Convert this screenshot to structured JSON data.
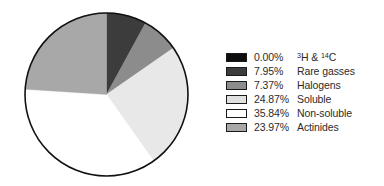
{
  "chart_data": {
    "type": "pie",
    "title": "",
    "subtitle": "",
    "xlabel": "",
    "ylabel": "",
    "legend_position": "right",
    "grid": false,
    "start_angle_deg": 0,
    "direction": "clockwise",
    "categories": [
      "3H & 14C",
      "Rare gasses",
      "Halogens",
      "Soluble",
      "Non-soluble",
      "Actinides"
    ],
    "values": [
      0.0,
      7.95,
      7.37,
      24.87,
      35.84,
      23.97
    ],
    "unit": "%",
    "slice_colors": [
      "#0d0d0d",
      "#3c3c3c",
      "#8c8c8c",
      "#e8e8e8",
      "#ffffff",
      "#a8a8a8"
    ],
    "slices": [
      {
        "label": "3H & 14C",
        "label_html": "<sup>3</sup>H &amp; <sup>14</sup>C",
        "value": 0.0,
        "percent_text": "0.00%",
        "color": "#0d0d0d",
        "swatch_color": "#0d0d0d"
      },
      {
        "label": "Rare gasses",
        "label_html": "Rare gasses",
        "value": 7.95,
        "percent_text": "7.95%",
        "color": "#3c3c3c",
        "swatch_color": "#3c3c3c"
      },
      {
        "label": "Halogens",
        "label_html": "Halogens",
        "value": 7.37,
        "percent_text": "7.37%",
        "color": "#8c8c8c",
        "swatch_color": "#8c8c8c"
      },
      {
        "label": "Soluble",
        "label_html": "Soluble",
        "value": 24.87,
        "percent_text": "24.87%",
        "color": "#e8e8e8",
        "swatch_color": "#e0e0e0"
      },
      {
        "label": "Non-soluble",
        "label_html": "Non-soluble",
        "value": 35.84,
        "percent_text": "35.84%",
        "color": "#ffffff",
        "swatch_color": "#ffffff"
      },
      {
        "label": "Actinides",
        "label_html": "Actinides",
        "value": 23.97,
        "percent_text": "23.97%",
        "color": "#a8a8a8",
        "swatch_color": "#a8a8a8"
      }
    ]
  },
  "pie": {
    "outline_color": "#111111",
    "outline_width": 1.6,
    "center_x": 83.5,
    "center_y": 83.5,
    "radius": 81.5
  },
  "legend": {
    "rows": [
      {
        "percent": "0.00%",
        "label": "3H & 14C"
      },
      {
        "percent": "7.95%",
        "label": "Rare gasses"
      },
      {
        "percent": "7.37%",
        "label": "Halogens"
      },
      {
        "percent": "24.87%",
        "label": "Soluble"
      },
      {
        "percent": "35.84%",
        "label": "Non-soluble"
      },
      {
        "percent": "23.97%",
        "label": "Actinides"
      }
    ]
  }
}
